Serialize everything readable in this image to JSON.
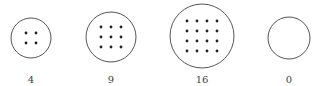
{
  "diagram": {
    "type": "dot-groups",
    "stroke_color": "#555555",
    "dot_color": "#222222",
    "groups": [
      {
        "count": 4,
        "label": "4",
        "cx": 31,
        "cy": 38,
        "r": 20,
        "grid": 2
      },
      {
        "count": 9,
        "label": "9",
        "cx": 111,
        "cy": 37,
        "r": 25,
        "grid": 3
      },
      {
        "count": 16,
        "label": "16",
        "cx": 202,
        "cy": 36,
        "r": 32,
        "grid": 4
      },
      {
        "count": 0,
        "label": "0",
        "cx": 289,
        "cy": 38,
        "r": 21,
        "grid": 0
      }
    ]
  }
}
